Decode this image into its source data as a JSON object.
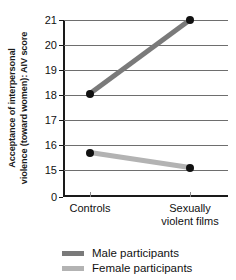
{
  "chart_data": {
    "type": "line",
    "title": "",
    "xlabel": "",
    "ylabel": "Acceptance of interpersonal violence (toward women): AIV score",
    "ylabel_lines": [
      "Acceptance of interpersonal",
      "violence  (toward women): AIV score"
    ],
    "categories": [
      "Controls",
      "Sexually violent films"
    ],
    "category_lines": [
      [
        "Controls"
      ],
      [
        "Sexually",
        "violent films"
      ]
    ],
    "series": [
      {
        "name": "Male participants",
        "values": [
          18.05,
          21.0
        ],
        "color": "#7a7a7a"
      },
      {
        "name": "Female participants",
        "values": [
          15.7,
          15.1
        ],
        "color": "#b3b3b3"
      }
    ],
    "yticks": [
      21,
      20,
      19,
      18,
      17,
      16,
      15,
      0
    ],
    "ytick_labels": [
      "21",
      "20",
      "19",
      "18",
      "17",
      "16",
      "15",
      "0"
    ],
    "ylim": [
      15,
      21
    ],
    "axis_break": true,
    "grid": true,
    "legend_position": "bottom",
    "marker": "filled-circle",
    "marker_color": "#111111"
  },
  "legend": {
    "items": [
      {
        "label": "Male participants",
        "color": "#7a7a7a"
      },
      {
        "label": "Female participants",
        "color": "#b3b3b3"
      }
    ]
  }
}
